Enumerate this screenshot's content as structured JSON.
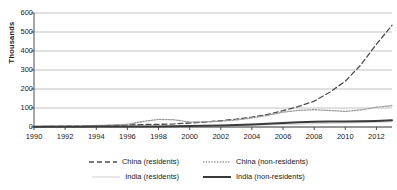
{
  "chart_data": {
    "type": "line",
    "title": "",
    "xlabel": "",
    "ylabel": "Thousands",
    "xlim": [
      1990,
      2013
    ],
    "ylim": [
      0,
      600
    ],
    "grid": true,
    "legend_position": "bottom",
    "x_ticks": [
      "1990",
      "1992",
      "1994",
      "1996",
      "1998",
      "2000",
      "2002",
      "2004",
      "2006",
      "2008",
      "2010",
      "2012"
    ],
    "y_ticks": [
      "0",
      "100",
      "200",
      "300",
      "400",
      "500",
      "600"
    ],
    "x": [
      1990,
      1991,
      1992,
      1993,
      1994,
      1995,
      1996,
      1997,
      1998,
      1999,
      2000,
      2001,
      2002,
      2003,
      2004,
      2005,
      2006,
      2007,
      2008,
      2009,
      2010,
      2011,
      2012,
      2013
    ],
    "series": [
      {
        "name": "China (residents)",
        "style": "dashed",
        "color": "#4d4d4d",
        "width": 1.3,
        "values": [
          2,
          3,
          4,
          5,
          6,
          8,
          11,
          13,
          14,
          16,
          21,
          26,
          33,
          41,
          52,
          66,
          86,
          108,
          136,
          183,
          241,
          327,
          436,
          535
        ]
      },
      {
        "name": "China (non-residents)",
        "style": "dotted",
        "color": "#9a9a9a",
        "width": 1.3,
        "values": [
          3,
          4,
          5,
          6,
          8,
          10,
          14,
          29,
          40,
          38,
          26,
          27,
          31,
          37,
          48,
          61,
          78,
          88,
          91,
          87,
          82,
          90,
          104,
          112
        ]
      },
      {
        "name": "India (residents)",
        "style": "solid",
        "color": "#cfcfcf",
        "width": 1.0,
        "values": [
          2,
          2,
          2,
          2,
          3,
          3,
          3,
          4,
          4,
          5,
          5,
          6,
          7,
          8,
          9,
          11,
          13,
          15,
          17,
          19,
          21,
          23,
          25,
          27
        ]
      },
      {
        "name": "India (non-residents)",
        "style": "solid",
        "color": "#3a3a3a",
        "width": 2.0,
        "values": [
          1,
          1,
          1,
          1,
          2,
          2,
          2,
          3,
          3,
          4,
          5,
          6,
          8,
          10,
          13,
          17,
          21,
          25,
          28,
          29,
          29,
          30,
          32,
          35
        ]
      }
    ]
  },
  "axes": {
    "y_title": "Thousands"
  },
  "legend": {
    "rows": [
      [
        {
          "label": "China (residents)",
          "style": "dashed",
          "color": "#4d4d4d",
          "width": 1.3
        },
        {
          "label": "China (non-residents)",
          "style": "dotted",
          "color": "#9a9a9a",
          "width": 1.3
        }
      ],
      [
        {
          "label": "India (residents)",
          "style": "solid",
          "color": "#cfcfcf",
          "width": 1.0
        },
        {
          "label": "India (non-residents)",
          "style": "solid",
          "color": "#3a3a3a",
          "width": 2.0
        }
      ]
    ]
  },
  "colors": {
    "background": "#ffffff",
    "grid": "#b3b3b3",
    "axis": "#4d4d4d",
    "text": "#1a1a1a"
  }
}
